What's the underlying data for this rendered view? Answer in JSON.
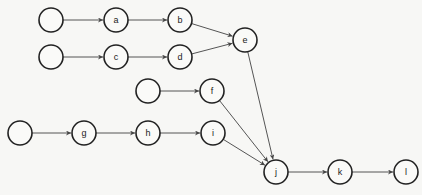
{
  "diagram": {
    "type": "directed-graph",
    "node_radius": 12,
    "colors": {
      "stroke": "#222222",
      "edge": "#555555",
      "background": "#f7f7f5"
    },
    "nodes": [
      {
        "id": "s1",
        "label": "",
        "x": 51,
        "y": 20
      },
      {
        "id": "a",
        "label": "a",
        "x": 116,
        "y": 20
      },
      {
        "id": "b",
        "label": "b",
        "x": 180,
        "y": 20
      },
      {
        "id": "s2",
        "label": "",
        "x": 51,
        "y": 57
      },
      {
        "id": "c",
        "label": "c",
        "x": 116,
        "y": 57
      },
      {
        "id": "d",
        "label": "d",
        "x": 180,
        "y": 57
      },
      {
        "id": "e",
        "label": "e",
        "x": 245,
        "y": 40
      },
      {
        "id": "s3",
        "label": "",
        "x": 148,
        "y": 91
      },
      {
        "id": "f",
        "label": "f",
        "x": 212,
        "y": 91
      },
      {
        "id": "s4",
        "label": "",
        "x": 20,
        "y": 133
      },
      {
        "id": "g",
        "label": "g",
        "x": 84,
        "y": 133
      },
      {
        "id": "h",
        "label": "h",
        "x": 148,
        "y": 133
      },
      {
        "id": "i",
        "label": "i",
        "x": 213,
        "y": 133
      },
      {
        "id": "j",
        "label": "j",
        "x": 276,
        "y": 172
      },
      {
        "id": "k",
        "label": "k",
        "x": 340,
        "y": 172
      },
      {
        "id": "l",
        "label": "l",
        "x": 406,
        "y": 172
      }
    ],
    "edges": [
      [
        "s1",
        "a"
      ],
      [
        "a",
        "b"
      ],
      [
        "b",
        "e"
      ],
      [
        "s2",
        "c"
      ],
      [
        "c",
        "d"
      ],
      [
        "d",
        "e"
      ],
      [
        "e",
        "j"
      ],
      [
        "s3",
        "f"
      ],
      [
        "f",
        "j"
      ],
      [
        "s4",
        "g"
      ],
      [
        "g",
        "h"
      ],
      [
        "h",
        "i"
      ],
      [
        "i",
        "j"
      ],
      [
        "j",
        "k"
      ],
      [
        "k",
        "l"
      ]
    ]
  }
}
